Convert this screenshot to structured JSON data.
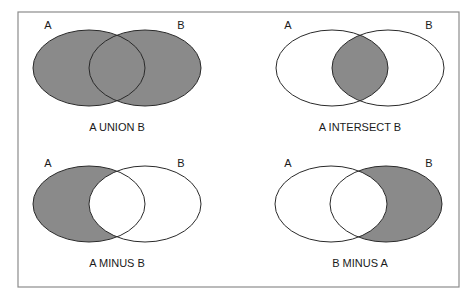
{
  "figure": {
    "frame": {
      "x": 18,
      "y": 12,
      "width": 441,
      "height": 275,
      "stroke": "#8c8c8c"
    },
    "colors": {
      "fill": "#8a8a8a",
      "stroke": "#2a2a2a",
      "background": "#ffffff"
    },
    "panels": [
      {
        "id": "union",
        "caption": "A UNION B",
        "caption_pos": [
          117,
          131
        ],
        "label_a": "A",
        "label_a_pos": [
          48,
          29
        ],
        "label_b": "B",
        "label_b_pos": [
          181,
          29
        ],
        "a": {
          "cx": 89,
          "cy": 68,
          "rx": 56,
          "ry": 38
        },
        "b": {
          "cx": 145,
          "cy": 68,
          "rx": 56,
          "ry": 38
        },
        "shade": "union"
      },
      {
        "id": "intersect",
        "caption": "A INTERSECT B",
        "caption_pos": [
          360,
          131
        ],
        "label_a": "A",
        "label_a_pos": [
          288,
          29
        ],
        "label_b": "B",
        "label_b_pos": [
          429,
          29
        ],
        "a": {
          "cx": 332,
          "cy": 68,
          "rx": 56,
          "ry": 38
        },
        "b": {
          "cx": 388,
          "cy": 68,
          "rx": 56,
          "ry": 38
        },
        "shade": "intersect"
      },
      {
        "id": "a-minus-b",
        "caption": "A MINUS B",
        "caption_pos": [
          117,
          267
        ],
        "label_a": "A",
        "label_a_pos": [
          48,
          167
        ],
        "label_b": "B",
        "label_b_pos": [
          181,
          167
        ],
        "a": {
          "cx": 89,
          "cy": 204,
          "rx": 56,
          "ry": 38
        },
        "b": {
          "cx": 145,
          "cy": 204,
          "rx": 56,
          "ry": 38
        },
        "shade": "a-minus-b"
      },
      {
        "id": "b-minus-a",
        "caption": "B MINUS A",
        "caption_pos": [
          360,
          267
        ],
        "label_a": "A",
        "label_a_pos": [
          288,
          167
        ],
        "label_b": "B",
        "label_b_pos": [
          429,
          167
        ],
        "a": {
          "cx": 331,
          "cy": 204,
          "rx": 56,
          "ry": 38
        },
        "b": {
          "cx": 386,
          "cy": 204,
          "rx": 56,
          "ry": 38
        },
        "shade": "b-minus-a"
      }
    ]
  }
}
